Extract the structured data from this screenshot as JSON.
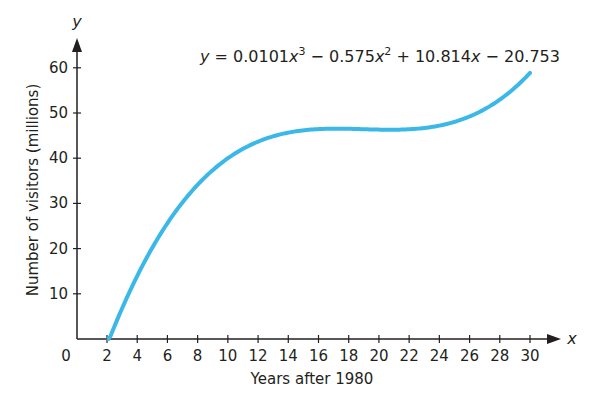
{
  "chart_data": {
    "type": "line",
    "title": "",
    "equation": "y = 0.0101x^3 − 0.575x^2 + 10.814x − 20.753",
    "equation_parts": {
      "y": "y",
      "eq": " = 0.0101",
      "x1": "x",
      "exp3": "3",
      "minus1": " − 0.575",
      "x2": "x",
      "exp2": "2",
      "plus": " + 10.814",
      "x3": "x",
      "minus2": " − 20.753"
    },
    "coefficients": {
      "a": 0.0101,
      "b": -0.575,
      "c": 10.814,
      "d": -20.753
    },
    "xlabel": "Years after 1980",
    "ylabel": "Number of visitors (millions)",
    "x_axis_var": "x",
    "y_axis_var": "y",
    "origin_label": "0",
    "xlim": [
      0,
      31
    ],
    "ylim": [
      0,
      65
    ],
    "x_ticks": [
      2,
      4,
      6,
      8,
      10,
      12,
      14,
      16,
      18,
      20,
      22,
      24,
      26,
      28,
      30
    ],
    "y_ticks": [
      10,
      20,
      30,
      40,
      50,
      60
    ],
    "grid": false,
    "legend": null,
    "series": [
      {
        "name": "Visitors model",
        "color": "#3bb8e8",
        "x": [
          2.1,
          4,
          6,
          8,
          10,
          12,
          14,
          16,
          18,
          20,
          22,
          24,
          26,
          28,
          30
        ],
        "values": [
          0.0,
          15.9,
          26.4,
          34.4,
          40.0,
          43.7,
          45.8,
          46.7,
          46.8,
          46.6,
          46.6,
          47.2,
          48.7,
          51.7,
          56.5
        ]
      }
    ]
  },
  "style": {
    "curve_color": "#3bb8e8",
    "axis_color": "#231f20"
  }
}
